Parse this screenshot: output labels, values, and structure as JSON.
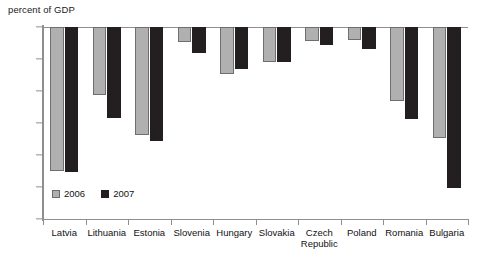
{
  "chart_data": {
    "type": "bar",
    "title": "",
    "ylabel": "percent of GDP",
    "xlabel": "",
    "ylim": [
      -30,
      0
    ],
    "yticks": [
      0,
      -5,
      -10,
      -15,
      -20,
      -25,
      -30
    ],
    "ytick_labels": [
      "0",
      "–5",
      "–10",
      "–15",
      "–20",
      "–25",
      "–30"
    ],
    "grid": false,
    "legend_position": "inside-bottom-left",
    "categories": [
      "Latvia",
      "Lithuania",
      "Estonia",
      "Slovenia",
      "Hungary",
      "Slovakia",
      "Czech Republic",
      "Poland",
      "Romania",
      "Bulgaria"
    ],
    "category_lines": [
      [
        "Latvia"
      ],
      [
        "Lithuania"
      ],
      [
        "Estonia"
      ],
      [
        "Slovenia"
      ],
      [
        "Hungary"
      ],
      [
        "Slovakia"
      ],
      [
        "Czech",
        "Republic"
      ],
      [
        "Poland"
      ],
      [
        "Romania"
      ],
      [
        "Bulgaria"
      ]
    ],
    "series": [
      {
        "name": "2006",
        "color": "#b0b0b0",
        "values": [
          -22.5,
          -10.6,
          -16.8,
          -2.4,
          -7.3,
          -5.5,
          -2.2,
          -2.0,
          -11.6,
          -17.4
        ]
      },
      {
        "name": "2007",
        "color": "#231f20",
        "values": [
          -22.7,
          -14.2,
          -17.8,
          -4.1,
          -6.6,
          -5.4,
          -2.8,
          -3.4,
          -14.4,
          -25.2
        ]
      }
    ]
  },
  "legend": {
    "items": [
      {
        "label": "2006"
      },
      {
        "label": "2007"
      }
    ]
  }
}
